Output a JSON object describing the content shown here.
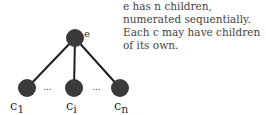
{
  "caption": "e has n children, numerated sequentially. Each c may have children of its own.",
  "root": {
    "label": "e"
  },
  "children": [
    {
      "base": "c",
      "sub": "1"
    },
    {
      "base": "c",
      "sub": "i"
    },
    {
      "base": "c",
      "sub": "n"
    }
  ],
  "ellipsis": "...",
  "colors": {
    "node": "#3a3a3a",
    "edge": "#1e1e1e",
    "text": "#333333"
  }
}
